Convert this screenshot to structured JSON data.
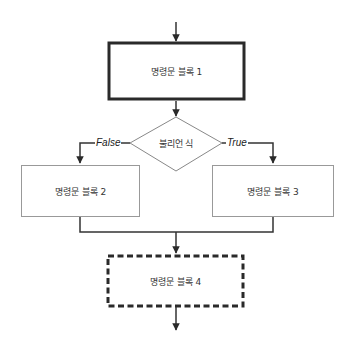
{
  "diagram": {
    "type": "flowchart",
    "nodes": [
      {
        "id": "block1",
        "shape": "rectangle",
        "style": "thick-solid",
        "label": "명령문 블록 1"
      },
      {
        "id": "cond",
        "shape": "diamond",
        "style": "thin-solid",
        "label": "불리언 식"
      },
      {
        "id": "block2",
        "shape": "rectangle",
        "style": "thin-solid",
        "label": "명령문 블록 2"
      },
      {
        "id": "block3",
        "shape": "rectangle",
        "style": "thin-solid",
        "label": "명령문 블록 3"
      },
      {
        "id": "block4",
        "shape": "rectangle",
        "style": "thick-dashed",
        "label": "명령문 블록 4"
      }
    ],
    "edges": [
      {
        "from": "start",
        "to": "block1",
        "label": ""
      },
      {
        "from": "block1",
        "to": "cond",
        "label": ""
      },
      {
        "from": "cond",
        "to": "block2",
        "label": "False"
      },
      {
        "from": "cond",
        "to": "block3",
        "label": "True"
      },
      {
        "from": "block2",
        "to": "block4",
        "label": ""
      },
      {
        "from": "block3",
        "to": "block4",
        "label": ""
      },
      {
        "from": "block4",
        "to": "end",
        "label": ""
      }
    ],
    "edge_labels": {
      "false": "False",
      "true": "True"
    },
    "colors": {
      "line": "#333333",
      "thin_border": "#999999",
      "background": "#ffffff"
    }
  }
}
